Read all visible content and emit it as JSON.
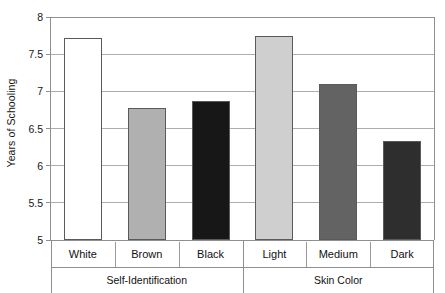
{
  "chart_data": {
    "type": "bar",
    "title": "",
    "subtitle": "",
    "xlabel": "",
    "ylabel": "Years of Schooling",
    "ylim": [
      5,
      8
    ],
    "ytick_values": [
      5,
      5.5,
      6,
      6.5,
      7,
      7.5,
      8
    ],
    "ytick_labels": [
      "5",
      "5.5",
      "6",
      "6.5",
      "7",
      "7.5",
      "8"
    ],
    "grid": true,
    "legend": "none",
    "categories": [
      "White",
      "Brown",
      "Black",
      "Light",
      "Medium",
      "Dark"
    ],
    "values": [
      7.72,
      6.77,
      6.87,
      7.75,
      7.1,
      6.33
    ],
    "bar_colors": [
      "#ffffff",
      "#b0b0b0",
      "#171717",
      "#cfcfcf",
      "#636363",
      "#2e2e2e"
    ],
    "bar_edge_color": "#5a5a5a",
    "grid_color": "#adadad",
    "axis_color": "#8f8f8f",
    "groups": [
      {
        "label": "Self-Identification",
        "categories": [
          "White",
          "Brown",
          "Black"
        ]
      },
      {
        "label": "Skin Color",
        "categories": [
          "Light",
          "Medium",
          "Dark"
        ]
      }
    ],
    "bars": [
      {
        "category": "White",
        "value": 7.72,
        "group": "Self-Identification",
        "color": "#ffffff"
      },
      {
        "category": "Brown",
        "value": 6.77,
        "group": "Self-Identification",
        "color": "#b0b0b0"
      },
      {
        "category": "Black",
        "value": 6.87,
        "group": "Self-Identification",
        "color": "#171717"
      },
      {
        "category": "Light",
        "value": 7.75,
        "group": "Skin Color",
        "color": "#cfcfcf"
      },
      {
        "category": "Medium",
        "value": 7.1,
        "group": "Skin Color",
        "color": "#636363"
      },
      {
        "category": "Dark",
        "value": 6.33,
        "group": "Skin Color",
        "color": "#2e2e2e"
      }
    ]
  }
}
